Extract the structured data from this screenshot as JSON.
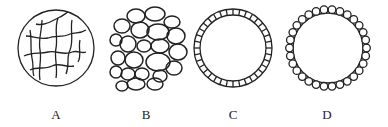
{
  "figures": [
    {
      "id": "A",
      "label": "A",
      "description": "circle with network of crossing fibers"
    },
    {
      "id": "B",
      "label": "B",
      "description": "cluster of many ovoid cells"
    },
    {
      "id": "C",
      "label": "C",
      "description": "hollow ring made of segmented blocks"
    },
    {
      "id": "D",
      "label": "D",
      "description": "hollow circle ringed by small beads"
    }
  ],
  "colors": {
    "stroke": "#222222",
    "background": "#ffffff"
  }
}
